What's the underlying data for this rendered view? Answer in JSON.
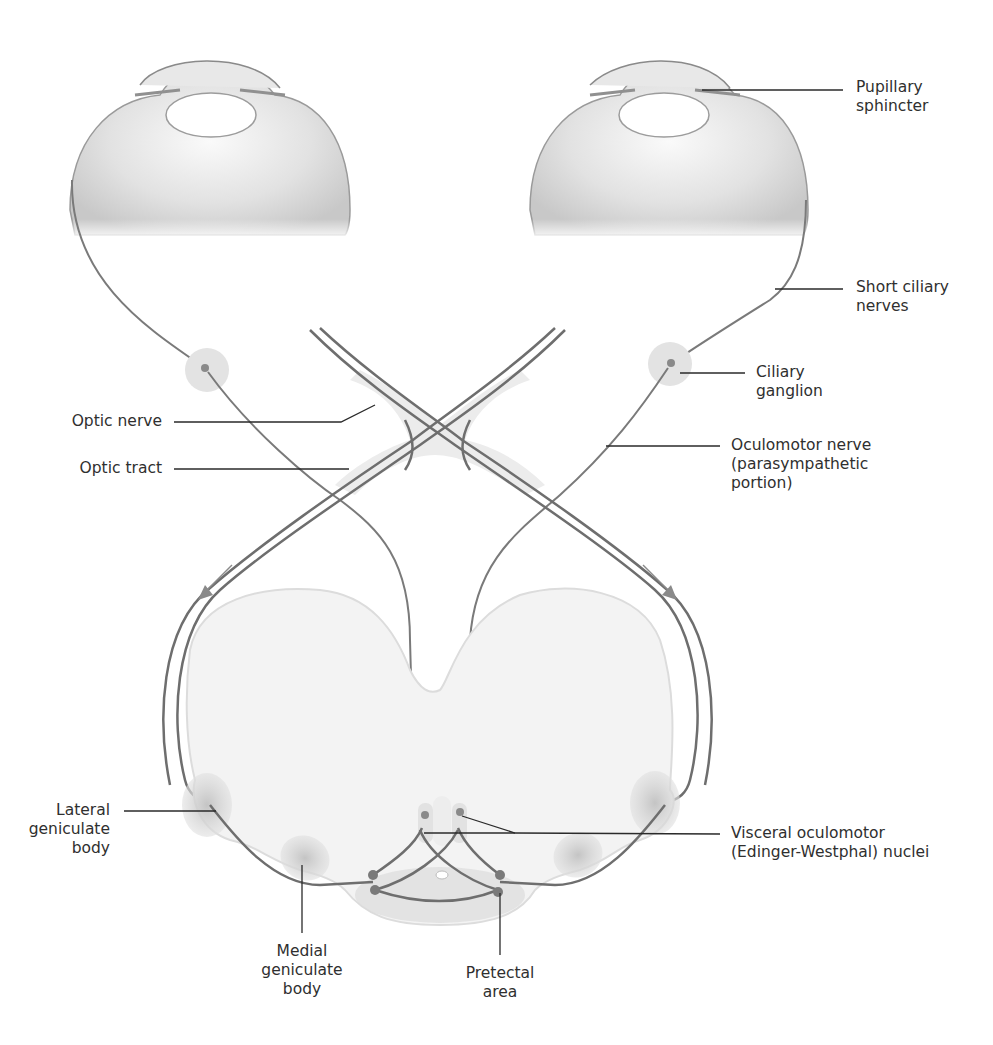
{
  "figure": {
    "colors": {
      "background": "#ffffff",
      "nerve_stroke": "#6e6e6e",
      "leader_line": "#2a2a2a",
      "tissue_fill": "#f1f1f1",
      "nucleus_fill": "#cfcfcf",
      "label_text": "#2f2f2f"
    }
  },
  "labels": {
    "pupillary_sphincter": "Pupillary\nsphincter",
    "short_ciliary_nerves": "Short ciliary\nnerves",
    "ciliary_ganglion": "Ciliary\nganglion",
    "optic_nerve": "Optic nerve",
    "optic_tract": "Optic tract",
    "oculomotor_nerve": "Oculomotor nerve\n(parasympathetic\nportion)",
    "lateral_geniculate_body": "Lateral\ngeniculate\nbody",
    "visceral_oculomotor_nuclei": "Visceral oculomotor\n(Edinger-Westphal) nuclei",
    "medial_geniculate_body": "Medial\ngeniculate\nbody",
    "pretectal_area": "Pretectal\narea"
  }
}
